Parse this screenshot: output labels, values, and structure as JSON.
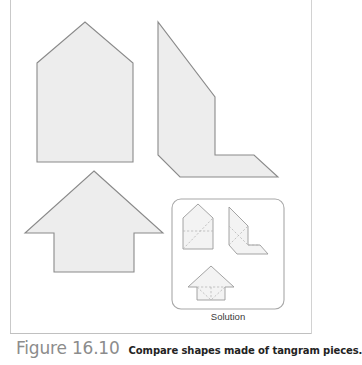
{
  "figure": {
    "number_label": "Figure 16.10",
    "caption": "Compare shapes made of tangram pieces.",
    "solution_label": "Solution",
    "top_cropped_text": "",
    "colors": {
      "shape_fill": "#ededed",
      "shape_stroke": "#8a8a8a",
      "dashed_stroke": "#b6b6b6",
      "box_stroke": "#a8a8a8",
      "page_rule": "#c9c9c9",
      "figure_number_color": "#8c8c8c",
      "caption_color": "#232323",
      "background": "#ffffff"
    }
  },
  "shapes": {
    "house": {
      "name": "house-pentagon",
      "points": "37,63 85,22 133,63 133,162 37,162"
    },
    "lshape": {
      "name": "l-shape-chevron",
      "points": "158,22 158,155 180,177 278,177 254,155 215,155 215,97"
    },
    "arrow": {
      "name": "up-arrow-pentagon",
      "points": "94,171 163,233 134,233 134,272 54,272 54,233 25,233"
    }
  },
  "solution_box": {
    "name": "solution-panel",
    "x": 172,
    "y": 199,
    "width": 112,
    "height": 110,
    "radius": 9,
    "pieces": {
      "house": {
        "outline": "183,218 198,204 213,218 213,249 183,249",
        "dashed": [
          "183,249 213,218",
          "183,231 213,231"
        ]
      },
      "lshape": {
        "outline": "229,207 229,245 237,254 268,254 260,245 248,245 248,226",
        "dashed": [
          "229,245 248,226",
          "229,226 248,245",
          "248,245 260,245"
        ]
      },
      "arrow": {
        "outline": "211,266 234,287 225,287 225,300 197,300 197,287 188,287",
        "dashed": [
          "197,287 225,287",
          "211,287 211,300",
          "197,287 211,300",
          "225,287 211,300"
        ]
      }
    }
  }
}
